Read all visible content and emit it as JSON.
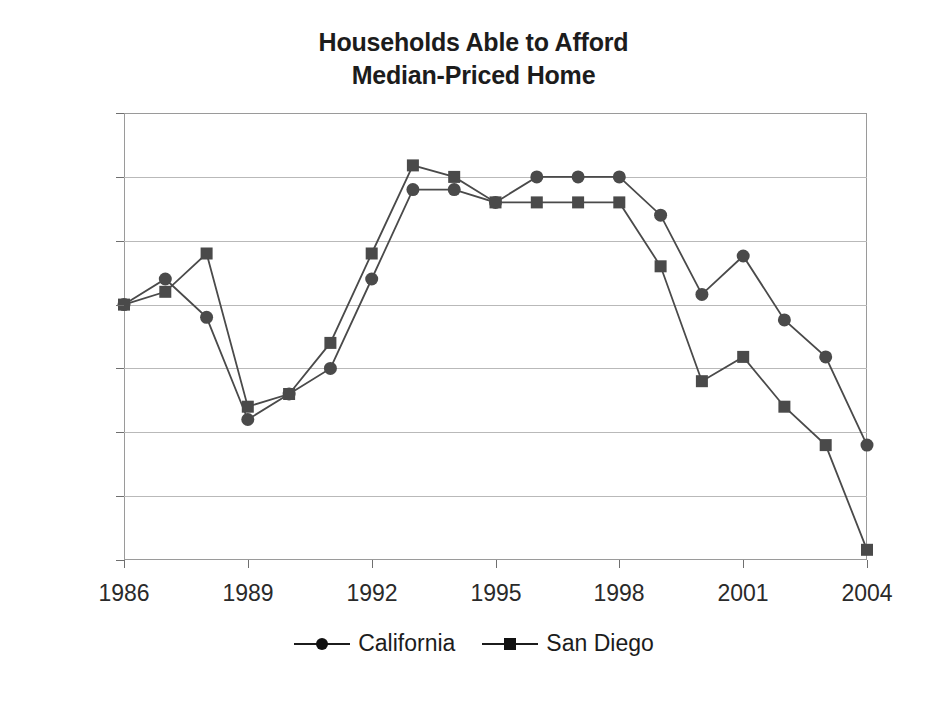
{
  "chart_data": {
    "type": "line",
    "title": "Households Able to Afford Median-Priced Home",
    "title_line1": "Households Able to Afford",
    "title_line2": "Median-Priced Home",
    "xlabel": "",
    "ylabel": "",
    "x": [
      1986,
      1987,
      1988,
      1989,
      1990,
      1991,
      1992,
      1993,
      1994,
      1995,
      1996,
      1997,
      1998,
      1999,
      2000,
      2001,
      2002,
      2003,
      2004
    ],
    "xlim": [
      1986,
      2004
    ],
    "ylim": [
      10,
      45
    ],
    "ytick_values": [
      45,
      40,
      35,
      30,
      25,
      20,
      15,
      10
    ],
    "ytick_labels": [
      "45%",
      "40%",
      "35%",
      "30%",
      "25%",
      "20%",
      "15%",
      "10%"
    ],
    "xtick_values": [
      1986,
      1989,
      1992,
      1995,
      1998,
      2001,
      2004
    ],
    "xtick_labels": [
      "1986",
      "1989",
      "1992",
      "1995",
      "1998",
      "2001",
      "2004"
    ],
    "grid": true,
    "grid_axis": "y",
    "legend_position": "bottom",
    "series": [
      {
        "name": "California",
        "marker": "circle",
        "color": "#4a4a4a",
        "values": [
          30,
          32,
          29,
          21,
          23,
          25,
          32,
          39,
          39,
          38,
          40,
          40,
          40,
          37,
          30.8,
          33.8,
          28.8,
          25.9,
          19
        ]
      },
      {
        "name": "San Diego",
        "marker": "square",
        "color": "#4a4a4a",
        "values": [
          30,
          31,
          34,
          22,
          23,
          27,
          34,
          40.9,
          40,
          38,
          38,
          38,
          38,
          33,
          24,
          25.9,
          22,
          19,
          10.8
        ]
      }
    ]
  },
  "legend": {
    "entries": [
      {
        "label": "California",
        "marker": "circle-marker"
      },
      {
        "label": "San Diego",
        "marker": "square-marker"
      }
    ]
  },
  "colors": {
    "line": "#4a4a4a",
    "marker": "#4a4a4a",
    "grid": "#b9b9b9",
    "frame": "#9a9a9a",
    "text": "#1c1c1c",
    "background": "#ffffff"
  }
}
